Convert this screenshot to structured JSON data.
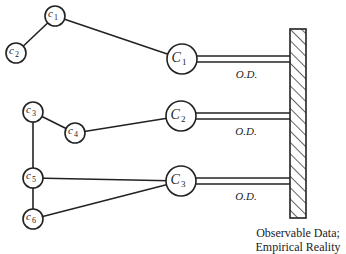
{
  "diagram": {
    "type": "concept-to-observation network",
    "wall": {
      "x": 290,
      "y": 29,
      "width": 16,
      "height": 189
    },
    "caption": {
      "line1": "Observable Data;",
      "line2": "Empirical Reality"
    },
    "major_nodes": [
      {
        "id": "C1",
        "label": "C",
        "sub": "1",
        "cx": 182,
        "cy": 59
      },
      {
        "id": "C2",
        "label": "C",
        "sub": "2",
        "cx": 181,
        "cy": 116
      },
      {
        "id": "C3",
        "label": "C",
        "sub": "3",
        "cx": 181,
        "cy": 181
      }
    ],
    "minor_nodes": [
      {
        "id": "c1",
        "label": "c",
        "sub": "1",
        "cx": 55,
        "cy": 16
      },
      {
        "id": "c2",
        "label": "c",
        "sub": "2",
        "cx": 16,
        "cy": 53
      },
      {
        "id": "c3",
        "label": "c",
        "sub": "3",
        "cx": 33,
        "cy": 112
      },
      {
        "id": "c4",
        "label": "c",
        "sub": "4",
        "cx": 75,
        "cy": 133
      },
      {
        "id": "c5",
        "label": "c",
        "sub": "5",
        "cx": 33,
        "cy": 178
      },
      {
        "id": "c6",
        "label": "c",
        "sub": "6",
        "cx": 33,
        "cy": 219
      }
    ],
    "edges": [
      [
        "c1",
        "c2"
      ],
      [
        "c1",
        "C1"
      ],
      [
        "c3",
        "c4"
      ],
      [
        "c4",
        "C2"
      ],
      [
        "c3",
        "c5"
      ],
      [
        "c5",
        "c6"
      ],
      [
        "c5",
        "C3"
      ],
      [
        "c6",
        "C3"
      ]
    ],
    "od_links": [
      {
        "from": "C1",
        "label": "O.D."
      },
      {
        "from": "C2",
        "label": "O.D."
      },
      {
        "from": "C3",
        "label": "O.D."
      }
    ]
  }
}
